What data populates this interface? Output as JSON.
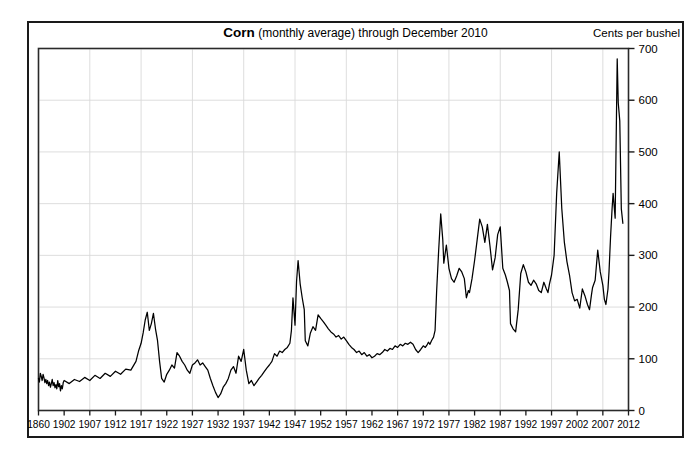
{
  "header": {
    "title_main": "Corn",
    "title_sub": "(monthly average) through December 2010",
    "units": "Cents per bushel"
  },
  "chart_data": {
    "type": "line",
    "title": "Corn (monthly average) through December 2010",
    "xlabel": "",
    "ylabel": "Cents per bushel",
    "ylim": [
      0,
      700
    ],
    "xlim": [
      1860,
      2012
    ],
    "grid": true,
    "legend": "none",
    "line_color": "#000000",
    "y_ticks": [
      0,
      100,
      200,
      300,
      400,
      500,
      600,
      700
    ],
    "x_ticks": [
      1860,
      1902,
      1907,
      1912,
      1917,
      1922,
      1927,
      1932,
      1937,
      1942,
      1947,
      1952,
      1957,
      1962,
      1967,
      1972,
      1977,
      1982,
      1987,
      1992,
      1997,
      2002,
      2007,
      2012
    ],
    "x_tick_labels": [
      "1860",
      "1902",
      "1907",
      "1912",
      "1917",
      "1922",
      "1927",
      "1932",
      "1937",
      "1942",
      "1947",
      "1952",
      "1957",
      "1962",
      "1967",
      "1972",
      "1977",
      "1982",
      "1987",
      "1992",
      "1997",
      "2002",
      "2007",
      "2012"
    ],
    "annotations": [
      "WWI spike near 1917 reaches about 190 cents",
      "Great Depression low near 1932 bottoms about 20 cents",
      "Post-WWII spike near 1947 reaches about 290 cents",
      "1973-74 commodity boom reaches about 380 cents",
      "1996 drought spike reaches about 500 cents",
      "2008 ethanol/commodity peak reaches about 680 cents",
      "Late 2010 rally reaches about 580 cents"
    ],
    "x": [
      1860,
      1861.5,
      1863,
      1864.5,
      1866,
      1867.5,
      1869,
      1870.5,
      1872,
      1873.5,
      1875,
      1876.5,
      1878,
      1879.5,
      1881,
      1882.5,
      1884,
      1885.5,
      1887,
      1888.5,
      1890,
      1891.5,
      1893,
      1894.5,
      1896,
      1897.5,
      1899,
      1900.5,
      1902,
      1903,
      1904,
      1905,
      1906,
      1907,
      1908,
      1909,
      1910,
      1911,
      1912,
      1913,
      1914,
      1915,
      1916,
      1916.5,
      1917,
      1917.4,
      1917.8,
      1918.2,
      1918.6,
      1919,
      1919.4,
      1919.8,
      1920.2,
      1920.6,
      1921,
      1921.5,
      1922,
      1922.5,
      1923,
      1923.5,
      1924,
      1924.5,
      1925,
      1925.5,
      1926,
      1926.5,
      1927,
      1927.5,
      1928,
      1928.5,
      1929,
      1929.5,
      1930,
      1930.5,
      1931,
      1931.5,
      1932,
      1932.5,
      1933,
      1933.5,
      1934,
      1934.5,
      1935,
      1935.5,
      1936,
      1936.5,
      1937,
      1937.5,
      1938,
      1938.5,
      1939,
      1939.5,
      1940,
      1940.5,
      1941,
      1941.5,
      1942,
      1942.5,
      1943,
      1943.5,
      1944,
      1944.5,
      1945,
      1945.5,
      1946,
      1946.3,
      1946.6,
      1947,
      1947.3,
      1947.6,
      1948,
      1948.4,
      1948.8,
      1949,
      1949.5,
      1950,
      1950.5,
      1951,
      1951.5,
      1952,
      1952.5,
      1953,
      1953.5,
      1954,
      1954.5,
      1955,
      1955.5,
      1956,
      1956.5,
      1957,
      1957.5,
      1958,
      1958.5,
      1959,
      1959.5,
      1960,
      1960.5,
      1961,
      1961.5,
      1962,
      1962.5,
      1963,
      1963.5,
      1964,
      1964.5,
      1965,
      1965.5,
      1966,
      1966.5,
      1967,
      1967.5,
      1968,
      1968.5,
      1969,
      1969.5,
      1970,
      1970.5,
      1971,
      1971.5,
      1972,
      1972.4,
      1972.8,
      1973,
      1973.3,
      1973.6,
      1974,
      1974.3,
      1974.6,
      1975,
      1975.4,
      1975.8,
      1976,
      1976.5,
      1977,
      1977.5,
      1978,
      1978.5,
      1979,
      1979.5,
      1980,
      1980.4,
      1980.8,
      1981,
      1981.5,
      1982,
      1982.5,
      1983,
      1983.5,
      1984,
      1984.5,
      1985,
      1985.5,
      1986,
      1986.5,
      1987,
      1987.5,
      1988,
      1988.4,
      1988.8,
      1989,
      1989.5,
      1990,
      1990.5,
      1991,
      1991.5,
      1992,
      1992.5,
      1993,
      1993.5,
      1994,
      1994.5,
      1995,
      1995.5,
      1996,
      1996.3,
      1996.6,
      1997,
      1997.5,
      1998,
      1998.5,
      1999,
      1999.5,
      2000,
      2000.5,
      2001,
      2001.5,
      2002,
      2002.5,
      2003,
      2003.5,
      2004,
      2004.4,
      2004.8,
      2005,
      2005.5,
      2006,
      2006.5,
      2007,
      2007.3,
      2007.6,
      2008,
      2008.2,
      2008.5,
      2008.8,
      2009,
      2009.4,
      2009.8,
      2010,
      2010.3,
      2010.6,
      2010.9
    ],
    "y": [
      62,
      55,
      72,
      66,
      58,
      70,
      63,
      54,
      60,
      52,
      58,
      48,
      55,
      45,
      52,
      60,
      48,
      54,
      44,
      50,
      42,
      58,
      46,
      52,
      38,
      48,
      42,
      54,
      58,
      52,
      60,
      56,
      64,
      58,
      68,
      62,
      72,
      66,
      76,
      70,
      80,
      78,
      95,
      115,
      130,
      150,
      175,
      190,
      155,
      168,
      188,
      158,
      135,
      95,
      62,
      55,
      70,
      78,
      88,
      82,
      112,
      105,
      95,
      88,
      78,
      72,
      88,
      92,
      98,
      88,
      92,
      85,
      78,
      62,
      48,
      35,
      25,
      32,
      45,
      52,
      62,
      78,
      85,
      72,
      105,
      95,
      118,
      78,
      52,
      58,
      48,
      55,
      62,
      68,
      75,
      82,
      88,
      95,
      110,
      105,
      115,
      112,
      118,
      122,
      130,
      155,
      218,
      165,
      250,
      290,
      245,
      218,
      195,
      135,
      125,
      150,
      162,
      155,
      185,
      178,
      172,
      165,
      158,
      152,
      148,
      142,
      145,
      138,
      142,
      135,
      128,
      122,
      118,
      112,
      115,
      108,
      112,
      105,
      108,
      102,
      105,
      110,
      108,
      112,
      118,
      115,
      120,
      118,
      125,
      122,
      128,
      125,
      130,
      128,
      132,
      128,
      118,
      112,
      118,
      125,
      122,
      128,
      132,
      128,
      135,
      142,
      155,
      230,
      310,
      380,
      330,
      285,
      320,
      275,
      255,
      248,
      260,
      275,
      268,
      255,
      218,
      232,
      228,
      255,
      290,
      330,
      370,
      355,
      325,
      360,
      318,
      272,
      295,
      340,
      355,
      275,
      262,
      248,
      232,
      168,
      158,
      152,
      195,
      265,
      282,
      268,
      248,
      242,
      252,
      245,
      232,
      228,
      248,
      235,
      228,
      245,
      262,
      300,
      420,
      500,
      390,
      325,
      288,
      262,
      228,
      212,
      215,
      198,
      235,
      222,
      205,
      195,
      225,
      238,
      252,
      310,
      268,
      242,
      215,
      205,
      235,
      268,
      335,
      390,
      420,
      372,
      680,
      595,
      560,
      390,
      362,
      330,
      365,
      342,
      385,
      355,
      580
    ]
  }
}
